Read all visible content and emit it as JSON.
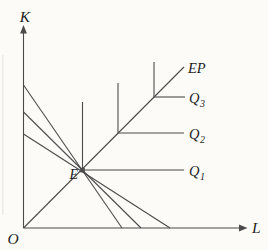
{
  "figure": {
    "colors": {
      "background": "#fcfbf8",
      "line": "#4b4b4b",
      "text": "#1f1f1f",
      "artifact": "#eae9e4"
    },
    "axes": {
      "y_label": "K",
      "x_label": "L",
      "origin_label": "O"
    },
    "expansion_path": {
      "label": "EP"
    },
    "equilibrium_point": {
      "label": "E"
    },
    "isoquants": [
      {
        "base": "Q",
        "sub": "1"
      },
      {
        "base": "Q",
        "sub": "2"
      },
      {
        "base": "Q",
        "sub": "3"
      }
    ]
  }
}
